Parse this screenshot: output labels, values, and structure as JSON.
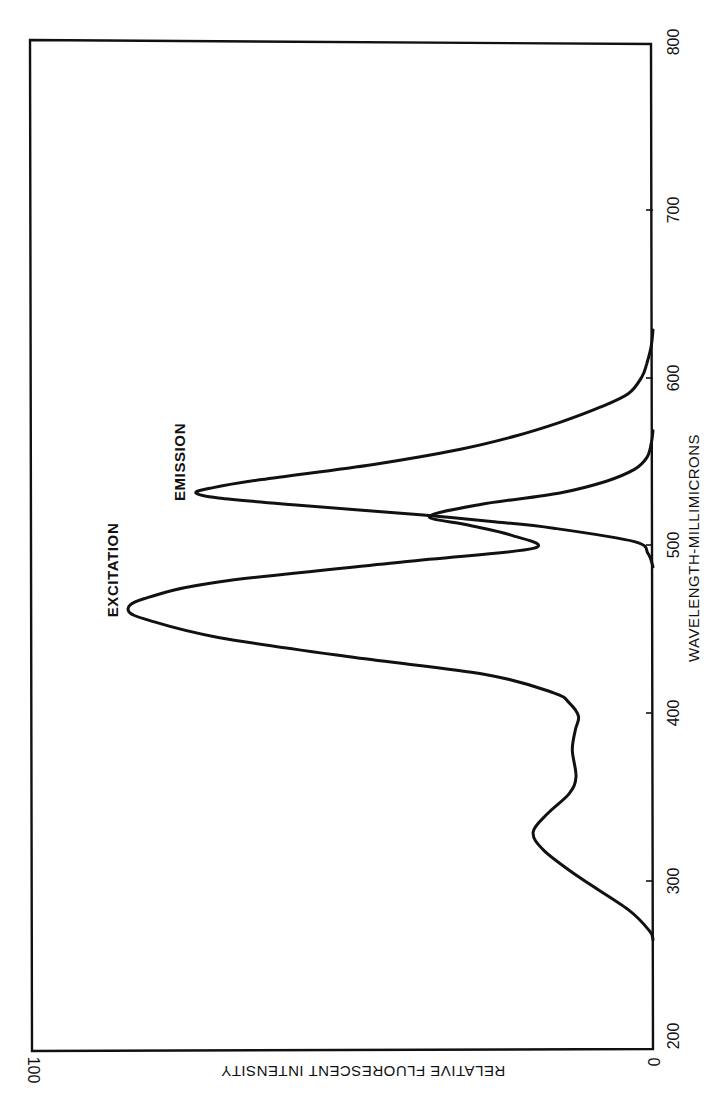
{
  "chart_data": {
    "type": "line",
    "orientation": "rotated-90-clockwise",
    "title": "",
    "xlabel": "WAVELENGTH-MILLIMICRONS",
    "ylabel": "RELATIVE FLUORESCENT INTENSITY",
    "xlim": [
      200,
      800
    ],
    "ylim": [
      0,
      100
    ],
    "x_ticks": [
      200,
      300,
      400,
      500,
      600,
      700,
      800
    ],
    "y_ticks": [
      0,
      100
    ],
    "grid": false,
    "legend": "none (curves labeled directly)",
    "series": [
      {
        "name": "EXCITATION",
        "x": [
          265,
          270,
          283,
          302,
          318,
          329,
          340,
          352,
          362,
          378,
          390,
          398,
          406,
          412,
          423,
          433,
          445,
          455,
          461,
          468,
          478,
          490,
          498,
          506,
          512,
          517,
          524,
          531,
          538,
          545,
          552,
          560,
          568
        ],
        "y": [
          0,
          0.5,
          4,
          11.8,
          17.5,
          19.3,
          17,
          13.5,
          12.4,
          13,
          12.5,
          12,
          13.5,
          16,
          27,
          48,
          70,
          81,
          84.5,
          82,
          70,
          40,
          19.3,
          23,
          30,
          36,
          28,
          15,
          7.5,
          3,
          1,
          0.3,
          0
        ]
      },
      {
        "name": "EMISSION",
        "x": [
          487,
          495,
          502,
          510,
          514,
          518,
          524,
          528,
          531,
          534,
          539,
          548,
          557,
          565,
          573,
          582,
          590,
          600,
          608,
          618,
          628
        ],
        "y": [
          0,
          0.8,
          3,
          16,
          26,
          37.5,
          58,
          70,
          73.6,
          71,
          63,
          45,
          31,
          22,
          15,
          8.5,
          4,
          1.8,
          1,
          0.3,
          0
        ]
      }
    ],
    "annotations": [
      {
        "text": "EXCITATION",
        "at_x": 461,
        "at_y": 84.5
      },
      {
        "text": "EMISSION",
        "at_x": 531,
        "at_y": 73.6
      }
    ]
  },
  "labels": {
    "xlabel": "WAVELENGTH-MILLIMICRONS",
    "ylabel": "RELATIVE FLUORESCENT INTENSITY",
    "excitation": "EXCITATION",
    "emission": "EMISSION",
    "x_tick_200": "200",
    "x_tick_300": "300",
    "x_tick_400": "400",
    "x_tick_500": "500",
    "x_tick_600": "600",
    "x_tick_700": "700",
    "x_tick_800": "800",
    "y_tick_0": "0",
    "y_tick_100": "100"
  },
  "style": {
    "line_color": "#111111",
    "background": "#ffffff"
  }
}
